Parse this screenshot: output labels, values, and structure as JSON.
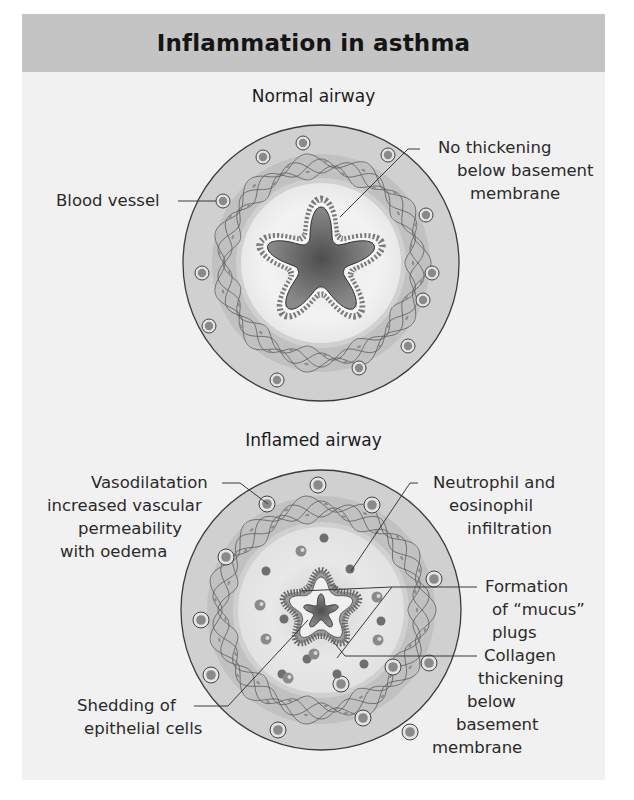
{
  "title": "Inflammation in asthma",
  "colors": {
    "header_bg": "#c4c4c4",
    "panel_bg": "#f1f1f1",
    "outer_tissue": "#cfcfcf",
    "lumen_dark": "#6a6a6a",
    "vessel_core": "#8a8a8a",
    "line": "#3a3a3a"
  },
  "normal": {
    "subtitle": "Normal airway",
    "labels": {
      "blood_vessel": "Blood vessel",
      "no_thickening": [
        "No thickening",
        "below basement",
        "membrane"
      ]
    }
  },
  "inflamed": {
    "subtitle": "Inflamed airway",
    "labels": {
      "vasodilatation": [
        "Vasodilatation",
        "increased vascular",
        "permeability",
        "with oedema"
      ],
      "neutrophil": [
        "Neutrophil and",
        "eosinophil",
        "infiltration"
      ],
      "mucus": [
        "Formation",
        "of “mucus”",
        "plugs"
      ],
      "collagen": [
        "Collagen",
        "thickening",
        "below",
        "basement",
        "membrane"
      ],
      "shedding": [
        "Shedding of",
        "epithelial cells"
      ]
    }
  }
}
